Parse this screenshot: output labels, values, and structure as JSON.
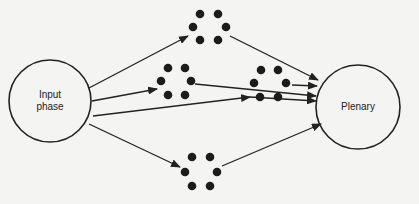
{
  "diagram": {
    "nodes": {
      "input": {
        "label_line1": "Input",
        "label_line2": "phase",
        "cx": 50,
        "cy": 101,
        "r": 41
      },
      "plenary": {
        "label": "Plenary",
        "cx": 358,
        "cy": 107,
        "r": 42
      }
    },
    "groups": [
      {
        "name": "top-group",
        "dots": [
          [
            200,
            14
          ],
          [
            218,
            14
          ],
          [
            193,
            27
          ],
          [
            226,
            27
          ],
          [
            200,
            40
          ],
          [
            218,
            40
          ]
        ]
      },
      {
        "name": "middle-left-group",
        "dots": [
          [
            168,
            68
          ],
          [
            185,
            68
          ],
          [
            161,
            81
          ],
          [
            191,
            81
          ],
          [
            168,
            95
          ],
          [
            185,
            95
          ]
        ]
      },
      {
        "name": "middle-right-group",
        "dots": [
          [
            261,
            70
          ],
          [
            278,
            70
          ],
          [
            254,
            83
          ],
          [
            286,
            83
          ],
          [
            260,
            97
          ],
          [
            278,
            97
          ]
        ]
      },
      {
        "name": "bottom-group",
        "dots": [
          [
            192,
            157
          ],
          [
            210,
            157
          ],
          [
            185,
            172
          ],
          [
            217,
            172
          ],
          [
            192,
            186
          ],
          [
            210,
            186
          ]
        ]
      }
    ],
    "arrows": [
      {
        "from": "input",
        "to": "top-group",
        "x1": 89,
        "y1": 88,
        "x2": 188,
        "y2": 36
      },
      {
        "from": "input",
        "to": "middle-left-group",
        "x1": 92,
        "y1": 101,
        "x2": 157,
        "y2": 89
      },
      {
        "from": "input",
        "to": "plenary",
        "x1": 93,
        "y1": 116,
        "x2": 250,
        "y2": 97
      },
      {
        "from": "input",
        "to": "bottom-group",
        "x1": 89,
        "y1": 124,
        "x2": 180,
        "y2": 167
      },
      {
        "from": "top-group",
        "to": "plenary",
        "x1": 230,
        "y1": 36,
        "x2": 318,
        "y2": 80
      },
      {
        "from": "middle-left-group",
        "to": "plenary",
        "x1": 195,
        "y1": 84,
        "x2": 316,
        "y2": 96
      },
      {
        "from": "middle-right-group",
        "to": "plenary",
        "x1": 292,
        "y1": 85,
        "x2": 317,
        "y2": 86
      },
      {
        "from": "middle-left-group-line",
        "to": "plenary",
        "x1": 250,
        "y1": 97,
        "x2": 316,
        "y2": 101
      },
      {
        "from": "bottom-group",
        "to": "plenary",
        "x1": 222,
        "y1": 166,
        "x2": 321,
        "y2": 124
      }
    ],
    "colors": {
      "stroke": "#222222",
      "dot": "#1c1c1c",
      "background": "#f4f4f2"
    }
  }
}
